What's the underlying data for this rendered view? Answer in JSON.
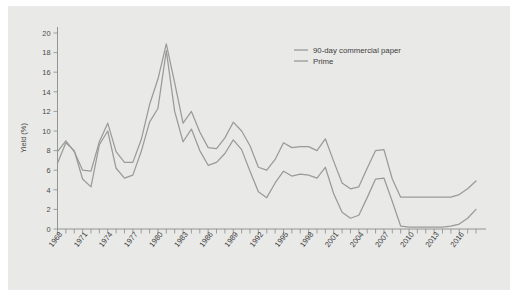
{
  "chart_data": {
    "type": "line",
    "title": "",
    "xlabel": "",
    "ylabel": "Yield (%)",
    "ylim": [
      0,
      20
    ],
    "ytick_values": [
      0,
      2,
      4,
      6,
      8,
      10,
      12,
      14,
      16,
      18,
      20
    ],
    "ytick_labels": [
      "0",
      "2",
      "4",
      "6",
      "8",
      "10",
      "12",
      "14",
      "16",
      "18",
      "20"
    ],
    "xlim": [
      1968,
      2018
    ],
    "xtick_labels": [
      "1968",
      "1971",
      "1974",
      "1977",
      "1980",
      "1983",
      "1986",
      "1989",
      "1992",
      "1995",
      "1998",
      "2001",
      "2004",
      "2007",
      "2010",
      "2013",
      "2016"
    ],
    "xtick_values": [
      1968,
      1971,
      1974,
      1977,
      1980,
      1983,
      1986,
      1989,
      1992,
      1995,
      1998,
      2001,
      2004,
      2007,
      2010,
      2013,
      2016
    ],
    "x": [
      1968,
      1969,
      1970,
      1971,
      1972,
      1973,
      1974,
      1975,
      1976,
      1977,
      1978,
      1979,
      1980,
      1981,
      1982,
      1983,
      1984,
      1985,
      1986,
      1987,
      1988,
      1989,
      1990,
      1991,
      1992,
      1993,
      1994,
      1995,
      1996,
      1997,
      1998,
      1999,
      2000,
      2001,
      2002,
      2003,
      2004,
      2005,
      2006,
      2007,
      2008,
      2009,
      2010,
      2011,
      2012,
      2013,
      2014,
      2015,
      2016,
      2017,
      2018
    ],
    "grid": false,
    "legend_position": "top-right",
    "series": [
      {
        "name": "90-day commercial paper",
        "color": "#9a9a98",
        "values": [
          6.7,
          8.8,
          8.0,
          5.1,
          4.3,
          8.6,
          10.0,
          6.2,
          5.2,
          5.5,
          7.9,
          10.9,
          12.3,
          18.2,
          12.0,
          8.9,
          10.2,
          8.0,
          6.5,
          6.8,
          7.7,
          9.1,
          8.1,
          5.9,
          3.8,
          3.2,
          4.7,
          5.9,
          5.4,
          5.6,
          5.5,
          5.2,
          6.3,
          3.6,
          1.7,
          1.1,
          1.4,
          3.2,
          5.1,
          5.2,
          2.8,
          0.3,
          0.2,
          0.2,
          0.2,
          0.2,
          0.2,
          0.3,
          0.5,
          1.1,
          2.0
        ]
      },
      {
        "name": "Prime",
        "color": "#9a9a98",
        "values": [
          7.9,
          9.0,
          7.9,
          6.0,
          5.9,
          8.9,
          10.8,
          7.9,
          6.8,
          6.8,
          9.1,
          12.7,
          15.3,
          18.9,
          14.9,
          10.8,
          12.0,
          9.9,
          8.3,
          8.2,
          9.3,
          10.9,
          10.0,
          8.5,
          6.3,
          6.0,
          7.1,
          8.8,
          8.3,
          8.4,
          8.4,
          8.0,
          9.2,
          6.9,
          4.7,
          4.1,
          4.3,
          6.2,
          8.0,
          8.1,
          5.1,
          3.25,
          3.25,
          3.25,
          3.25,
          3.25,
          3.25,
          3.26,
          3.51,
          4.1,
          4.9
        ]
      }
    ]
  },
  "legend": {
    "entries": [
      {
        "label": "90-day commercial paper"
      },
      {
        "label": "Prime"
      }
    ]
  }
}
